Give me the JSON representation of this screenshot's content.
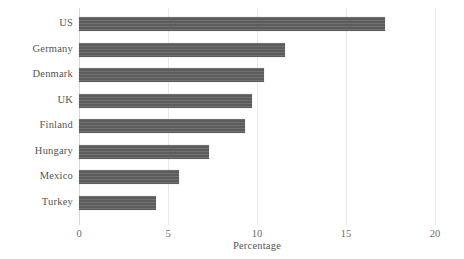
{
  "chart_data": {
    "type": "bar",
    "orientation": "horizontal",
    "title": "",
    "subtitle": "",
    "xlabel": "Percentage",
    "ylabel": "",
    "categories": [
      "US",
      "Germany",
      "Denmark",
      "UK",
      "Finland",
      "Hungary",
      "Mexico",
      "Turkey"
    ],
    "values": [
      17.2,
      11.6,
      10.4,
      9.7,
      9.3,
      7.3,
      5.6,
      4.3
    ],
    "xlim": [
      0,
      20
    ],
    "xticks": [
      0,
      5,
      10,
      15,
      20
    ],
    "xtick_labels": [
      "0",
      "5",
      "10",
      "15",
      "20"
    ],
    "grid": "vertical",
    "legend": "none",
    "bar_color": "#5c5c5c",
    "gridline_color": "#e9e9e9",
    "text_color": "#555555"
  }
}
